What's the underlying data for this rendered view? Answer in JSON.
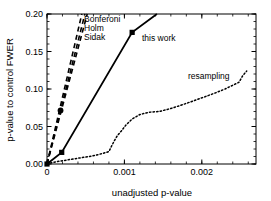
{
  "chart_data": {
    "type": "line",
    "title": "",
    "xlabel": "unadjusted p-value",
    "ylabel": "p-value to control FWER",
    "xlim": [
      0,
      0.0027
    ],
    "ylim": [
      0,
      0.2
    ],
    "grid": false,
    "legend_position": "inline-annotations",
    "x_ticks": [
      {
        "value": 0,
        "label": "0"
      },
      {
        "value": 0.001,
        "label": "0.001"
      },
      {
        "value": 0.002,
        "label": "0.002"
      }
    ],
    "y_ticks": [
      {
        "value": 0.0,
        "label": "0.00"
      },
      {
        "value": 0.05,
        "label": "0.05"
      },
      {
        "value": 0.1,
        "label": "0.10"
      },
      {
        "value": 0.15,
        "label": "0.15"
      },
      {
        "value": 0.2,
        "label": "0.20"
      }
    ],
    "x_minor_step": 0.0002,
    "y_minor_step": 0.01,
    "series": [
      {
        "name": "Bonferoni",
        "style": "dashed",
        "color": "#000000",
        "x": [
          0.0,
          0.00045
        ],
        "y": [
          0.0,
          0.2
        ]
      },
      {
        "name": "Holm",
        "style": "dashed",
        "color": "#000000",
        "x": [
          0.0,
          0.00052
        ],
        "y": [
          0.0,
          0.2
        ]
      },
      {
        "name": "Sidak",
        "style": "dashed",
        "color": "#000000",
        "x": [
          0.0,
          0.00049
        ],
        "y": [
          0.0,
          0.2
        ],
        "markers": [
          {
            "x": 0.000175,
            "y": 0.0715,
            "shape": "circle"
          }
        ]
      },
      {
        "name": "this work",
        "style": "solid",
        "color": "#000000",
        "x": [
          0.0,
          0.00019,
          0.0011,
          0.00142
        ],
        "y": [
          0.0,
          0.0155,
          0.1755,
          0.2
        ],
        "markers": [
          {
            "x": 0.00019,
            "y": 0.0155,
            "shape": "square"
          },
          {
            "x": 0.0011,
            "y": 0.1755,
            "shape": "square"
          }
        ]
      },
      {
        "name": "resampling",
        "style": "dotted",
        "color": "#000000",
        "x": [
          0.0,
          8e-05,
          0.00018,
          0.0003,
          0.00042,
          0.00055,
          0.00066,
          0.00075,
          0.0008,
          0.00083,
          0.00087,
          0.00091,
          0.00096,
          0.00102,
          0.0011,
          0.0012,
          0.00132,
          0.00145,
          0.0016,
          0.00175,
          0.0019,
          0.00205,
          0.00218,
          0.0023,
          0.0024,
          0.00248,
          0.00253,
          0.00258
        ],
        "y": [
          0.0,
          0.0022,
          0.004,
          0.006,
          0.008,
          0.01,
          0.0125,
          0.015,
          0.0165,
          0.023,
          0.031,
          0.038,
          0.044,
          0.052,
          0.06,
          0.066,
          0.069,
          0.07,
          0.074,
          0.079,
          0.0845,
          0.09,
          0.095,
          0.1,
          0.105,
          0.109,
          0.118,
          0.124
        ]
      }
    ],
    "annotations": [
      {
        "text": "Bonferoni",
        "x_px": 84,
        "y_px": 22,
        "anchor": "start"
      },
      {
        "text": "Holm",
        "x_px": 84,
        "y_px": 31,
        "anchor": "start"
      },
      {
        "text": "Sidak",
        "x_px": 84,
        "y_px": 40,
        "anchor": "start"
      },
      {
        "text": "this work",
        "x_px": 142,
        "y_px": 41,
        "anchor": "start"
      },
      {
        "text": "resampling",
        "x_px": 188,
        "y_px": 79,
        "anchor": "start"
      }
    ]
  },
  "axes": {
    "xlabel": "unadjusted p-value",
    "ylabel": "p-value to control FWER"
  },
  "colors": {
    "foreground": "#000000",
    "background": "#ffffff"
  }
}
